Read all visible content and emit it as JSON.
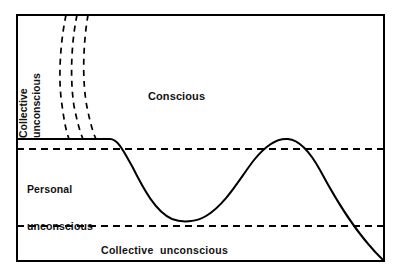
{
  "diagram": {
    "frame": {
      "x": 16,
      "y": 14,
      "width": 369,
      "height": 248,
      "stroke_color": "#000000",
      "stroke_width": 2,
      "fill_color": "#ffffff"
    },
    "labels": {
      "conscious": "Conscious",
      "personal_line1": "Personal",
      "personal_line2": "unconscious",
      "collective_bottom": "Collective  unconscious",
      "collective_side_line1": "Collective",
      "collective_side_line2": "unconscious"
    },
    "strata": [
      {
        "name": "conscious",
        "label": "Conscious",
        "boundary_y": 139
      },
      {
        "name": "personal-unconscious",
        "label": "Personal unconscious",
        "boundary_y": 149
      },
      {
        "name": "collective-unconscious",
        "label": "Collective unconscious",
        "boundary_y": 226
      }
    ],
    "lines": {
      "solid_threshold": {
        "name": "consciousness-threshold",
        "from_x": 16,
        "to_x": 110,
        "y": 139,
        "style": "solid",
        "stroke_width": 2,
        "color": "#000000"
      },
      "dashed_upper": {
        "name": "personal-unconscious-boundary",
        "from_x": 16,
        "to_x": 385,
        "y": 149,
        "style": "dashed",
        "dash_pattern": "7,5",
        "stroke_width": 2,
        "color": "#000000"
      },
      "dashed_lower": {
        "name": "collective-unconscious-boundary",
        "from_x": 16,
        "to_x": 385,
        "y": 226,
        "style": "dashed",
        "dash_pattern": "7,5",
        "stroke_width": 2,
        "color": "#000000"
      }
    },
    "ego_curve": {
      "name": "ego-consciousness-curve",
      "style": "solid",
      "stroke_width": 2,
      "color": "#000000",
      "path": "M 16 139 L 110 139 C 118 139 124 152 132 166 C 144 190 156 212 172 219 C 182 223 196 222 206 216 C 226 204 240 178 254 160 C 266 145 278 138 288 139 C 300 140 310 152 320 170 C 336 200 356 234 385 261",
      "key_points": [
        {
          "label": "threshold-start",
          "x": 16,
          "y": 139
        },
        {
          "label": "threshold-break",
          "x": 110,
          "y": 139
        },
        {
          "label": "trough",
          "x": 190,
          "y": 221
        },
        {
          "label": "crest",
          "x": 288,
          "y": 139
        },
        {
          "label": "end",
          "x": 385,
          "y": 261
        }
      ]
    },
    "archetype_curves": {
      "name": "archetype-dashed-curves",
      "count": 3,
      "style": "dashed",
      "dash_pattern": "6,5",
      "stroke_width": 1.7,
      "color": "#000000",
      "paths": [
        "M 66 14 C 60 44 58 80 62 105 C 64 120 66 131 69 139",
        "M 77 14 C 71 44 70 80 74 106 C 77 121 80 132 83 139",
        "M 88 14 C 83 44 82 82 87 107 C 90 122 93 133 96 139"
      ]
    }
  }
}
